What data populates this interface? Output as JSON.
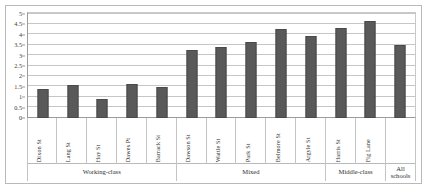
{
  "chart_data": {
    "type": "bar",
    "title": "",
    "subtitle": "",
    "xlabel": "",
    "ylabel": "",
    "ylim": [
      0,
      5
    ],
    "ytick_step": 0.5,
    "grid": true,
    "legend": null,
    "bar_color": "#595959",
    "categories": [
      "Dixon St",
      "Lang St",
      "Hay St",
      "Dawes Pt",
      "Barrack St",
      "Dawson St",
      "Wattle St",
      "Park St",
      "Belmore St",
      "Argyle St",
      "Harris St",
      "Fig Lane",
      "All schools"
    ],
    "values": [
      1.4,
      1.55,
      0.9,
      1.6,
      1.5,
      3.25,
      3.4,
      3.6,
      4.25,
      3.9,
      4.3,
      4.6,
      3.5
    ],
    "ytick_labels": [
      "0",
      "0.5",
      "1",
      "1.5",
      "2",
      "2.5",
      "3",
      "3.5",
      "4",
      "4.5",
      "5"
    ],
    "ytick_values": [
      0,
      0.5,
      1,
      1.5,
      2,
      2.5,
      3,
      3.5,
      4,
      4.5,
      5
    ],
    "groups": [
      {
        "label": "Working-class",
        "start": 0,
        "count": 5
      },
      {
        "label": "Mixed",
        "start": 5,
        "count": 5
      },
      {
        "label": "Middle-class",
        "start": 10,
        "count": 2
      },
      {
        "label": "All\nschools",
        "start": 12,
        "count": 1
      }
    ]
  }
}
